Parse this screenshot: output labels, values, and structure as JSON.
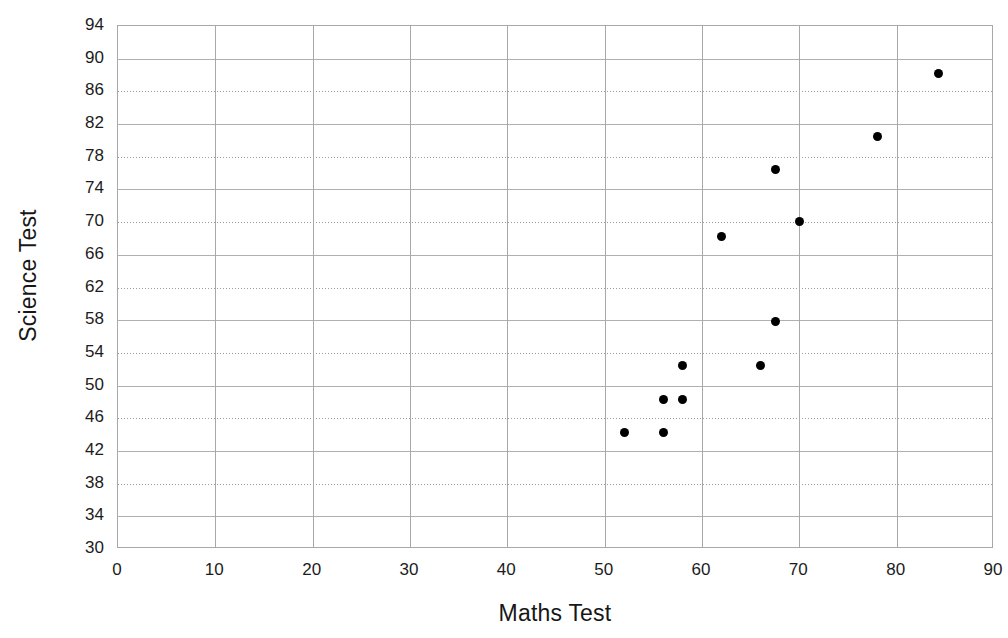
{
  "chart_data": {
    "type": "scatter",
    "title": "",
    "xlabel": "Maths Test",
    "ylabel": "Science Test",
    "xlim": [
      0,
      90
    ],
    "ylim": [
      30,
      94
    ],
    "x_ticks": [
      0,
      10,
      20,
      30,
      40,
      50,
      60,
      70,
      80,
      90
    ],
    "y_ticks": [
      30,
      34,
      38,
      42,
      46,
      50,
      54,
      58,
      62,
      66,
      70,
      74,
      78,
      82,
      86,
      90,
      94
    ],
    "grid": "both-axes-major",
    "legend": "none",
    "series": [
      {
        "name": "students",
        "marker": "filled-circle",
        "color": "#000000",
        "points": [
          {
            "x": 52.0,
            "y": 44.3
          },
          {
            "x": 56.0,
            "y": 44.3
          },
          {
            "x": 56.0,
            "y": 48.3
          },
          {
            "x": 58.0,
            "y": 48.3
          },
          {
            "x": 58.0,
            "y": 52.4
          },
          {
            "x": 62.0,
            "y": 68.2
          },
          {
            "x": 66.0,
            "y": 52.4
          },
          {
            "x": 67.5,
            "y": 57.8
          },
          {
            "x": 67.5,
            "y": 76.5
          },
          {
            "x": 70.0,
            "y": 70.1
          },
          {
            "x": 78.0,
            "y": 80.5
          },
          {
            "x": 84.3,
            "y": 88.2
          }
        ]
      }
    ]
  },
  "axes": {
    "x_title": "Maths Test",
    "y_title": "Science Test",
    "x_tick_labels": [
      "0",
      "10",
      "20",
      "30",
      "40",
      "50",
      "60",
      "70",
      "80",
      "90"
    ],
    "y_tick_labels": [
      "30",
      "34",
      "38",
      "42",
      "46",
      "50",
      "54",
      "58",
      "62",
      "66",
      "70",
      "74",
      "78",
      "82",
      "86",
      "90",
      "94"
    ]
  },
  "style": {
    "marker_color": "#000000",
    "grid_color": "#a8a8a8",
    "plot_border_color": "#a8a8a8",
    "background": "#ffffff"
  }
}
